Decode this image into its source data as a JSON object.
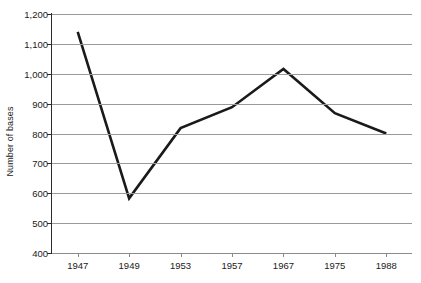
{
  "chart_data": {
    "type": "line",
    "title": "",
    "xlabel": "",
    "ylabel": "Number of bases",
    "categories": [
      "1947",
      "1949",
      "1953",
      "1957",
      "1967",
      "1975",
      "1988"
    ],
    "values": [
      1140,
      583,
      818,
      888,
      1016,
      868,
      800
    ],
    "series": [
      {
        "name": "Number of bases",
        "values": [
          1140,
          583,
          818,
          888,
          1016,
          868,
          800
        ]
      }
    ],
    "ylim": [
      400,
      1200
    ],
    "ytick_step": 100,
    "ytick_labels": [
      "1,200",
      "1,100",
      "1,000",
      "900",
      "800",
      "700",
      "600",
      "500",
      "400"
    ],
    "ytick_values": [
      1200,
      1100,
      1000,
      900,
      800,
      700,
      600,
      500,
      400
    ],
    "grid": true,
    "grid_axis": "y",
    "legend": false,
    "legend_position": "none",
    "line_color": "#1a1a1a",
    "grid_color": "#9a9a9a",
    "background_color": "#ffffff"
  }
}
